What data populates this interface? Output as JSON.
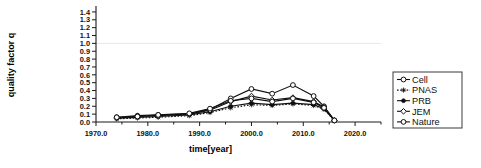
{
  "chart_data": {
    "type": "line",
    "title": "",
    "xlabel": "time[year]",
    "ylabel": "quality factor q",
    "xlim": [
      1970.0,
      2025.0
    ],
    "ylim": [
      0.0,
      1.45
    ],
    "grid": "single horizontal gridline at y=1.0",
    "legend_position": "right-outside",
    "x_ticks": [
      "1970.0",
      "1980.0",
      "1990.0",
      "2000.0",
      "2010.0",
      "2020.0"
    ],
    "x_tick_values": [
      1970,
      1980,
      1990,
      2000,
      2010,
      2020
    ],
    "y_ticks": [
      "0.0",
      "0.1",
      "0.2",
      "0.3",
      "0.4",
      "0.5",
      "0.6",
      "0.7",
      "0.8",
      "0.9",
      "1.0",
      "1.1",
      "1.2",
      "1.3",
      "1.4"
    ],
    "y_tick_values": [
      0.0,
      0.1,
      0.2,
      0.3,
      0.4,
      0.5,
      0.6,
      0.7,
      0.8,
      0.9,
      1.0,
      1.1,
      1.2,
      1.3,
      1.4
    ],
    "series": [
      {
        "name": "Cell",
        "marker": "open-circle",
        "linestyle": "solid",
        "x": [
          1974,
          1978,
          1982,
          1988,
          1992,
          1996,
          2000,
          2004,
          2008,
          2012,
          2014,
          2016
        ],
        "values": [
          0.06,
          0.08,
          0.09,
          0.1,
          0.16,
          0.3,
          0.42,
          0.36,
          0.47,
          0.33,
          0.2,
          0.02
        ]
      },
      {
        "name": "PNAS",
        "marker": "star",
        "linestyle": "dotted",
        "x": [
          1974,
          1978,
          1982,
          1988,
          1992,
          1996,
          2000,
          2004,
          2008,
          2012,
          2014,
          2016
        ],
        "values": [
          0.04,
          0.05,
          0.06,
          0.08,
          0.12,
          0.18,
          0.22,
          0.21,
          0.23,
          0.21,
          0.16,
          0.02
        ]
      },
      {
        "name": "PRB",
        "marker": "filled-star",
        "linestyle": "solid",
        "x": [
          1974,
          1978,
          1982,
          1988,
          1992,
          1996,
          2000,
          2004,
          2008,
          2012,
          2014,
          2016
        ],
        "values": [
          0.05,
          0.06,
          0.07,
          0.09,
          0.13,
          0.2,
          0.24,
          0.22,
          0.24,
          0.22,
          0.17,
          0.02
        ]
      },
      {
        "name": "JEM",
        "marker": "open-diamond",
        "linestyle": "solid",
        "x": [
          1974,
          1978,
          1982,
          1988,
          1992,
          1996,
          2000,
          2004,
          2008,
          2012,
          2014,
          2016
        ],
        "values": [
          0.05,
          0.07,
          0.08,
          0.1,
          0.15,
          0.26,
          0.33,
          0.28,
          0.31,
          0.26,
          0.19,
          0.02
        ]
      },
      {
        "name": "Nature",
        "marker": "open-circle",
        "linestyle": "solid",
        "x": [
          1974,
          1978,
          1982,
          1988,
          1992,
          1996,
          2000,
          2004,
          2008,
          2012,
          2014,
          2016
        ],
        "values": [
          0.06,
          0.07,
          0.09,
          0.11,
          0.17,
          0.27,
          0.3,
          0.26,
          0.3,
          0.25,
          0.18,
          0.02
        ]
      }
    ]
  },
  "legend": {
    "items": [
      {
        "label": "Cell"
      },
      {
        "label": "PNAS"
      },
      {
        "label": "PRB"
      },
      {
        "label": "JEM"
      },
      {
        "label": "Nature"
      }
    ]
  },
  "colors": {
    "line": "#111111",
    "axis": "#1a1a1a",
    "grid": "#e8e8e8",
    "legend_border": "#3a3a3a",
    "background": "#ffffff"
  }
}
